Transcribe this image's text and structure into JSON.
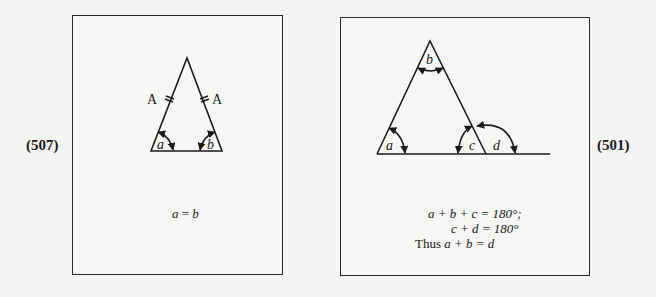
{
  "figures": [
    {
      "number": "(507)",
      "labels": {
        "side_left": "A",
        "side_right": "A",
        "angle_left": "a",
        "angle_right": "b"
      },
      "caption": {
        "lhs": "a",
        "op": " = ",
        "rhs": "b"
      }
    },
    {
      "number": "(501)",
      "labels": {
        "angle_a": "a",
        "angle_b": "b",
        "angle_c": "c",
        "angle_d": "d"
      },
      "caption": {
        "line1": "a + b + c = 180°;",
        "line2": "c + d = 180°",
        "line3_prefix": "Thus ",
        "line3": "a + b = d"
      }
    }
  ]
}
